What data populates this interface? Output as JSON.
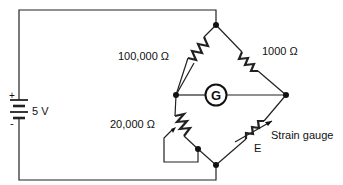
{
  "diagram": {
    "battery": {
      "label": "5 V",
      "plus": "+",
      "minus": "-"
    },
    "resistors": [
      {
        "id": "r1",
        "label": "100,000 Ω",
        "position": "top-left"
      },
      {
        "id": "r2",
        "label": "1000 Ω",
        "position": "top-right"
      },
      {
        "id": "r3",
        "label": "20,000 Ω",
        "position": "bottom-left",
        "variable": true
      }
    ],
    "galvanometer": {
      "label": "G"
    },
    "strain_gauge": {
      "label": "Strain gauge",
      "symbol_label": "E"
    },
    "colors": {
      "line": "#222222",
      "background": "#ffffff"
    }
  }
}
